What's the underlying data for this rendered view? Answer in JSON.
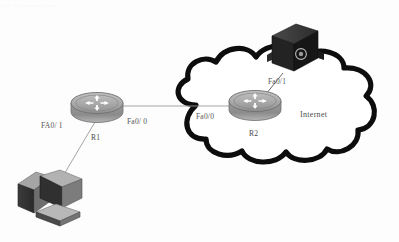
{
  "diagram": {
    "title_remnant": "— —  —— ——",
    "background_color": "#fdfdfd",
    "cloud": {
      "label": "Internet",
      "outline_color": "#0d0d0d",
      "fill_color": "#ffffff"
    },
    "nodes": [
      {
        "id": "pc1",
        "type": "desktop-pc",
        "label": "",
        "body_color": "#8a8a8a",
        "dark_color": "#2e2e2e"
      },
      {
        "id": "r1",
        "type": "router",
        "label": "R1",
        "body_color": "#9a9a9a",
        "top_color": "#b0b0b0",
        "icon": "four-way-arrow-icon"
      },
      {
        "id": "r2",
        "type": "router",
        "label": "R2",
        "body_color": "#9a9a9a",
        "top_color": "#b0b0b0",
        "icon": "four-way-arrow-icon"
      },
      {
        "id": "server1",
        "type": "server-box",
        "label": "",
        "body_color": "#1c1c1c",
        "top_color": "#3a3a3a",
        "emblem": "circle-emblem-icon"
      }
    ],
    "links": [
      {
        "id": "pc1-r1",
        "from": "pc1",
        "to": "r1",
        "label": "FA0/1",
        "label_side": "left"
      },
      {
        "id": "r1-r2",
        "from": "r1",
        "to": "r2",
        "label_from": "Fa0/ 0",
        "label_to": "Fa0/0"
      },
      {
        "id": "r2-server1",
        "from": "r2",
        "to": "server1",
        "label": "Fa0/1",
        "label_side": "right"
      }
    ],
    "labels": {
      "r1_name": "R1",
      "r2_name": "R2",
      "r1_fa01": "FA0/ 1",
      "r1_fa00": "Fa0/ 0",
      "r2_fa00": "Fa0/0",
      "r2_fa01": "Fa0/1",
      "internet": "Internet"
    }
  }
}
